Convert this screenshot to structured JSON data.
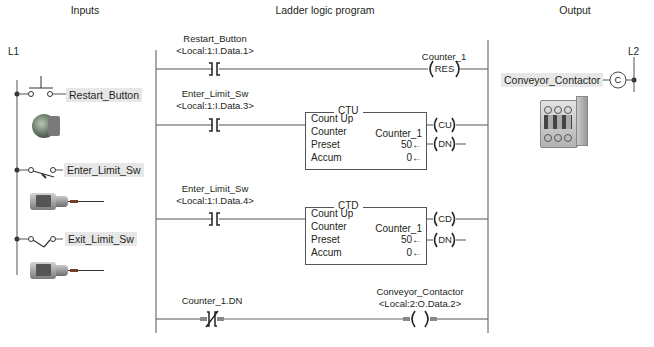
{
  "headers": {
    "inputs": "Inputs",
    "ladder": "Ladder logic program",
    "output": "Output"
  },
  "rails": {
    "left": "L1",
    "right": "L2"
  },
  "inputs": [
    {
      "label": "Restart_Button",
      "symbol": "pushbutton-no",
      "photo": "pushbutton-icon"
    },
    {
      "label": "Enter_Limit_Sw",
      "symbol": "limit-switch-no",
      "photo": "limit-switch-icon"
    },
    {
      "label": "Exit_Limit_Sw",
      "symbol": "limit-switch-no",
      "photo": "limit-switch-icon"
    }
  ],
  "output": {
    "label": "Conveyor_Contactor",
    "coil_letter": "C",
    "photo": "contactor-icon"
  },
  "rungs": [
    {
      "contact_tag": "Restart_Button",
      "contact_address": "<Local:1:I.Data.1>",
      "contact_type": "XIC",
      "coil_tag": "Counter_1",
      "coil_label": "RES"
    },
    {
      "contact_tag": "Enter_Limit_Sw",
      "contact_address": "<Local:1:I.Data.3>",
      "contact_type": "XIC",
      "block": {
        "title": "CTU",
        "rows": [
          "Count Up",
          "Counter",
          "Preset",
          "Accum"
        ],
        "counter": "Counter_1",
        "preset": "50←",
        "accum": "0←",
        "out1": "CU",
        "out2": "DN"
      }
    },
    {
      "contact_tag": "Enter_Limit_Sw",
      "contact_address": "<Local:1:I.Data.4>",
      "contact_type": "XIC",
      "block": {
        "title": "CTD",
        "rows": [
          "Count Up",
          "Counter",
          "Preset",
          "Accum"
        ],
        "counter": "Counter_1",
        "preset": "50←",
        "accum": "0←",
        "out1": "CD",
        "out2": "DN"
      }
    },
    {
      "contact_tag": "Counter_1.DN",
      "contact_type": "XIO",
      "coil_tag": "Conveyor_Contactor",
      "coil_address": "<Local:2:O.Data.2>",
      "coil_label": ""
    }
  ]
}
